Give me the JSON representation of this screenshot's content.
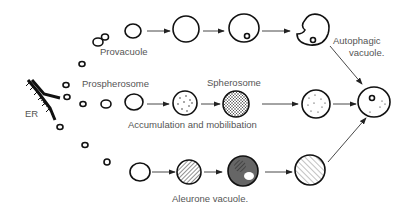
{
  "diagram": {
    "labels": {
      "er": "ER",
      "provacuole": "Provacuole",
      "prospherosome": "Prospherosome",
      "spherosome": "Spherosome",
      "accumulation": "Accumulation and mobilibation",
      "autophagic": "Autophagic",
      "autophagic2": "vacuole.",
      "aleurone": "Aleurone vacuole."
    },
    "pathways": [
      "autophagic vacuole",
      "spherosome",
      "aleurone vacuole"
    ]
  }
}
